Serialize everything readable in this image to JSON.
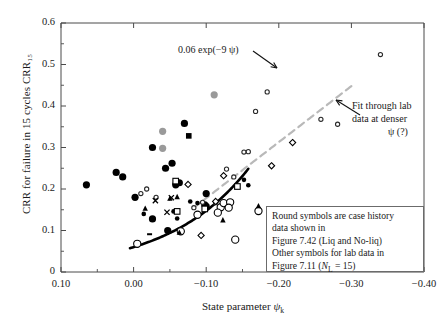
{
  "chart_data": {
    "type": "scatter",
    "title": "",
    "xlabel": "State parameter ψₖ",
    "ylabel": "CRR for failure in 15 cycles CRR₁₅",
    "xlim": [
      0.1,
      -0.4
    ],
    "ylim": [
      0.0,
      0.6
    ],
    "xticks": [
      "0.10",
      "0.00",
      "−0.10",
      "−0.20",
      "−0.30",
      "−0.40"
    ],
    "xtick_values": [
      0.1,
      0.0,
      -0.1,
      -0.2,
      -0.3,
      -0.4
    ],
    "yticks": [
      "0",
      "0.1",
      "0.2",
      "0.3",
      "0.4",
      "0.5",
      "0.6"
    ],
    "ytick_values": [
      0.0,
      0.1,
      0.2,
      0.3,
      0.4,
      0.5,
      0.6
    ],
    "x_axis_reversed": true,
    "grid": false,
    "minor_ticks": true,
    "legend_position": "bottom-right-box",
    "series": [
      {
        "name": "case-history-filled-circle-large",
        "marker": "filled-circle",
        "size": 7.2,
        "color": "#000000",
        "points": [
          [
            0.065,
            0.21
          ],
          [
            0.024,
            0.24
          ],
          [
            0.015,
            0.229
          ],
          [
            -0.002,
            0.18
          ],
          [
            -0.026,
            0.3
          ],
          [
            -0.07,
            0.358
          ],
          [
            -0.053,
            0.262
          ],
          [
            -0.044,
            0.25
          ],
          [
            -0.058,
            0.21
          ],
          [
            -0.063,
            0.215
          ],
          [
            -0.1,
            0.189
          ],
          [
            -0.026,
            0.128
          ],
          [
            -0.047,
            0.1
          ],
          [
            -0.1,
            0.158
          ],
          [
            -0.098,
            0.162
          ]
        ]
      },
      {
        "name": "case-history-filled-circle-small",
        "marker": "filled-circle",
        "size": 4.6,
        "color": "#000000",
        "points": [
          [
            -0.014,
            0.14
          ],
          [
            -0.055,
            0.146
          ],
          [
            -0.06,
            0.129
          ],
          [
            -0.152,
            0.222
          ],
          [
            -0.158,
            0.209
          ],
          [
            -0.078,
            0.17
          ],
          [
            -0.088,
            0.166
          ]
        ]
      },
      {
        "name": "case-history-gray-filled-circle",
        "marker": "filled-circle",
        "size": 7.2,
        "color": "#9a9a9a",
        "points": [
          [
            -0.04,
            0.339
          ],
          [
            -0.04,
            0.298
          ],
          [
            -0.111,
            0.427
          ]
        ]
      },
      {
        "name": "case-history-open-circle-large",
        "marker": "open-circle",
        "size": 7.2,
        "color": "#000000",
        "points": [
          [
            -0.088,
            0.138
          ],
          [
            -0.12,
            0.156
          ],
          [
            -0.124,
            0.166
          ],
          [
            -0.133,
            0.168
          ],
          [
            -0.131,
            0.155
          ],
          [
            -0.116,
            0.143
          ],
          [
            -0.065,
            0.098
          ],
          [
            -0.14,
            0.078
          ],
          [
            -0.005,
            0.068
          ],
          [
            -0.172,
            0.147
          ]
        ]
      },
      {
        "name": "lab-open-circle-small",
        "marker": "open-circle",
        "size": 4.2,
        "color": "#2a2a2a",
        "points": [
          [
            -0.018,
            0.2
          ],
          [
            -0.095,
            0.168
          ],
          [
            -0.113,
            0.167
          ],
          [
            -0.128,
            0.248
          ],
          [
            -0.138,
            0.229
          ],
          [
            -0.152,
            0.289
          ],
          [
            -0.158,
            0.29
          ],
          [
            -0.168,
            0.387
          ],
          [
            -0.184,
            0.434
          ],
          [
            -0.258,
            0.368
          ],
          [
            -0.281,
            0.356
          ],
          [
            -0.34,
            0.524
          ],
          [
            -0.01,
            0.189
          ],
          [
            -0.031,
            0.18
          ],
          [
            -0.083,
            0.155
          ]
        ]
      },
      {
        "name": "lab-filled-square",
        "marker": "filled-square",
        "size": 5.6,
        "color": "#000000",
        "points": [
          [
            -0.076,
            0.328
          ]
        ]
      },
      {
        "name": "lab-open-square",
        "marker": "open-square",
        "size": 5.6,
        "color": "#000000",
        "points": [
          [
            -0.058,
            0.219
          ],
          [
            -0.143,
            0.206
          ],
          [
            -0.06,
            0.146
          ],
          [
            -0.098,
            0.152
          ]
        ]
      },
      {
        "name": "lab-open-diamond",
        "marker": "open-diamond",
        "size": 6.2,
        "color": "#000000",
        "points": [
          [
            -0.075,
            0.211
          ],
          [
            -0.124,
            0.232
          ],
          [
            -0.19,
            0.256
          ],
          [
            -0.219,
            0.312
          ],
          [
            -0.093,
            0.088
          ],
          [
            -0.113,
            0.17
          ]
        ]
      },
      {
        "name": "lab-filled-triangle",
        "marker": "filled-triangle",
        "size": 5.4,
        "color": "#000000",
        "points": [
          [
            -0.016,
            0.154
          ],
          [
            -0.05,
            0.178
          ],
          [
            -0.06,
            0.182
          ],
          [
            -0.123,
            0.126
          ],
          [
            -0.063,
            0.096
          ],
          [
            -0.172,
            0.16
          ]
        ]
      },
      {
        "name": "lab-cross-marker",
        "marker": "x-cross",
        "size": 5.2,
        "color": "#000000",
        "points": [
          [
            -0.03,
            0.172
          ],
          [
            -0.046,
            0.144
          ],
          [
            -0.052,
            0.179
          ]
        ]
      },
      {
        "name": "lab-dash-marker",
        "marker": "dash",
        "size": 5.0,
        "color": "#000000",
        "points": [
          [
            -0.022,
            0.091
          ]
        ]
      }
    ],
    "curves": [
      {
        "name": "exponential-fit",
        "label": "0.06 exp(−9 ψ)",
        "style": "solid",
        "color": "#000000",
        "width": 2.6,
        "equation": "CRR = 0.06 exp(-9 psi)",
        "x_range": [
          0.005,
          -0.158
        ]
      },
      {
        "name": "lab-data-fit",
        "label": "Fit through lab data at denser ψ (?)",
        "style": "dashed",
        "color": "#b9b9b9",
        "width": 2.2,
        "x_range": [
          -0.083,
          -0.3
        ]
      }
    ],
    "annotations": [
      {
        "name": "curve-equation-annotation",
        "text": "0.06 exp(−9 ψ)",
        "target": "exponential-fit",
        "arrow": true
      },
      {
        "name": "dashed-fit-annotation",
        "line1": "Fit through lab",
        "line2": "data at denser",
        "line3": "ψ (?)",
        "target": "lab-data-fit",
        "arrow": true
      }
    ],
    "legend_lines": [
      "Round symbols are case history",
      "data shown in",
      "Figure 7.42 (Liq and No-liq)",
      "Other symbols for lab data in"
    ],
    "legend_last_line_prefix": "Figure 7.11 (",
    "legend_last_line_italic": "N",
    "legend_last_line_sub": "L",
    "legend_last_line_suffix": " = 15)"
  },
  "axes": {
    "xlabel_prefix": "State parameter ",
    "xlabel_symbol": "ψ",
    "xlabel_sub": "k"
  },
  "colors": {
    "frame": "#4a4a4a",
    "text": "#1a1a1a",
    "solid_curve": "#000000",
    "dashed_curve": "#b9b9b9",
    "gray_marker": "#9a9a9a",
    "legend_border": "#6b6b6b"
  }
}
